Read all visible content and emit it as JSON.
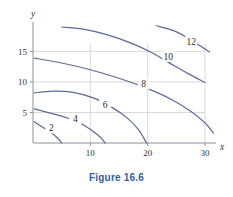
{
  "caption": "Figure 16.6",
  "colors": {
    "contour": "#5b6a99",
    "grid": "#cfcfcf",
    "axis": "#8e9099",
    "text": "#333333",
    "caption": "#2f5fa8",
    "background": "#ffffff"
  },
  "axes": {
    "x_name": "x",
    "y_name": "y",
    "x_ticks": [
      10,
      20,
      30
    ],
    "y_ticks": [
      5,
      10,
      15
    ]
  },
  "chart_data": {
    "type": "line",
    "title": "Figure 16.6",
    "xlabel": "x",
    "ylabel": "y",
    "xlim": [
      0,
      33
    ],
    "ylim": [
      0,
      20
    ],
    "grid": true,
    "legend": "none",
    "xticks": [
      10,
      20,
      30
    ],
    "yticks": [
      5,
      10,
      15
    ],
    "contour_levels": [
      2,
      4,
      6,
      8,
      10,
      12
    ],
    "series": [
      {
        "name": "2",
        "label": "2",
        "label_xy": [
          3.2,
          2.4
        ],
        "points": [
          [
            0.2,
            3.5
          ],
          [
            1.5,
            2.7
          ],
          [
            3.0,
            1.8
          ],
          [
            4.2,
            0.9
          ],
          [
            5.0,
            0.0
          ]
        ]
      },
      {
        "name": "4",
        "label": "4",
        "label_xy": [
          7.4,
          3.9
        ],
        "points": [
          [
            0.2,
            5.6
          ],
          [
            3.0,
            4.9
          ],
          [
            6.0,
            4.1
          ],
          [
            8.5,
            3.1
          ],
          [
            10.5,
            1.9
          ],
          [
            11.8,
            0.9
          ],
          [
            12.6,
            0.0
          ]
        ]
      },
      {
        "name": "6",
        "label": "6",
        "label_xy": [
          12.6,
          6.3
        ],
        "points": [
          [
            0.2,
            8.2
          ],
          [
            3.5,
            8.5
          ],
          [
            7.0,
            8.3
          ],
          [
            10.5,
            7.4
          ],
          [
            13.5,
            6.0
          ],
          [
            16.3,
            4.2
          ],
          [
            18.4,
            2.2
          ],
          [
            19.8,
            0.0
          ]
        ]
      },
      {
        "name": "8",
        "label": "8",
        "label_xy": [
          19.3,
          9.6
        ],
        "points": [
          [
            0.2,
            13.9
          ],
          [
            5.0,
            13.1
          ],
          [
            10.0,
            12.0
          ],
          [
            15.0,
            10.6
          ],
          [
            20.0,
            8.9
          ],
          [
            24.0,
            7.2
          ],
          [
            27.5,
            5.2
          ],
          [
            30.0,
            3.3
          ],
          [
            31.5,
            1.6
          ]
        ]
      },
      {
        "name": "10",
        "label": "10",
        "label_xy": [
          23.6,
          14.1
        ],
        "points": [
          [
            5.0,
            19.0
          ],
          [
            9.0,
            18.6
          ],
          [
            13.0,
            17.7
          ],
          [
            17.0,
            16.4
          ],
          [
            20.5,
            14.9
          ],
          [
            24.0,
            13.0
          ],
          [
            27.0,
            11.4
          ],
          [
            30.0,
            9.9
          ]
        ]
      },
      {
        "name": "12",
        "label": "12",
        "label_xy": [
          27.6,
          16.6
        ],
        "points": [
          [
            21.5,
            19.2
          ],
          [
            24.5,
            18.4
          ],
          [
            27.0,
            17.2
          ],
          [
            29.0,
            16.0
          ],
          [
            30.8,
            14.9
          ]
        ]
      }
    ]
  }
}
